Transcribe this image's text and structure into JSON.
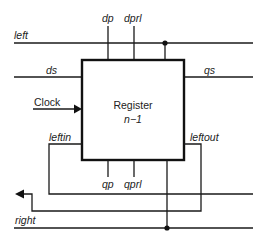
{
  "diagram": {
    "block": {
      "title": "Register",
      "subtitle": "n−1"
    },
    "signals": {
      "left": "left",
      "right": "right",
      "ds": "ds",
      "qs": "qs",
      "clock": "Clock",
      "dp": "dp",
      "dprl": "dprl",
      "qp": "qp",
      "qprl": "qprl",
      "leftin": "leftin",
      "leftout": "leftout"
    },
    "colors": {
      "line": "#1a1a1a",
      "background": "#ffffff"
    }
  }
}
